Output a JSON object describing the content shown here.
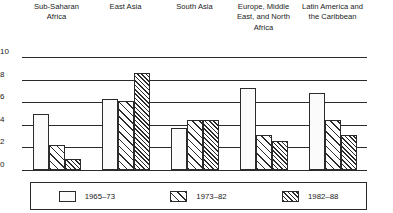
{
  "chart_data": {
    "type": "bar",
    "title": "",
    "subtitle": "",
    "xlabel": "",
    "ylabel": "",
    "ylim": [
      0,
      10
    ],
    "yticks": [
      0,
      2,
      4,
      6,
      8,
      10
    ],
    "grid": true,
    "legend_position": "bottom",
    "categories": [
      "Sub-Saharan\nAfrica",
      "East Asia",
      "South Asia",
      "Europe, Middle\nEast, and North\nAfrica",
      "Latin America and\nthe Caribbean"
    ],
    "series": [
      {
        "name": "1965–73",
        "pattern": "solid-white",
        "values": [
          5.0,
          6.3,
          3.7,
          7.3,
          6.8
        ]
      },
      {
        "name": "1973–82",
        "pattern": "wide-diagonal-hatch",
        "values": [
          2.2,
          6.1,
          4.4,
          3.1,
          4.4
        ]
      },
      {
        "name": "1982–88",
        "pattern": "dense-diagonal-hatch",
        "values": [
          1.0,
          8.6,
          4.4,
          2.6,
          3.1
        ]
      }
    ]
  },
  "axis": {
    "ytick_labels": [
      "10",
      "8",
      "6",
      "4",
      "2",
      "0"
    ]
  },
  "legend": {
    "items": [
      {
        "label": "1965–73"
      },
      {
        "label": "1973–82"
      },
      {
        "label": "1982–88"
      }
    ]
  }
}
